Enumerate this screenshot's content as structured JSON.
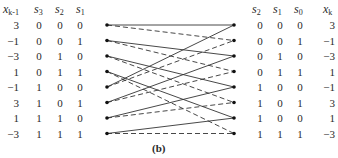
{
  "figure": {
    "caption": "(b)",
    "left_table": {
      "headers": [
        {
          "var": "x",
          "sub": "k-1"
        },
        {
          "var": "s",
          "sub": "3"
        },
        {
          "var": "s",
          "sub": "2"
        },
        {
          "var": "s",
          "sub": "1"
        }
      ],
      "rows": [
        [
          "3",
          "0",
          "0",
          "0"
        ],
        [
          "−1",
          "0",
          "0",
          "1"
        ],
        [
          "−3",
          "0",
          "1",
          "0"
        ],
        [
          "1",
          "0",
          "1",
          "1"
        ],
        [
          "−1",
          "1",
          "0",
          "0"
        ],
        [
          "3",
          "1",
          "0",
          "1"
        ],
        [
          "1",
          "1",
          "1",
          "0"
        ],
        [
          "−3",
          "1",
          "1",
          "1"
        ]
      ]
    },
    "right_table": {
      "headers": [
        {
          "var": "s",
          "sub": "2"
        },
        {
          "var": "s",
          "sub": "1"
        },
        {
          "var": "s",
          "sub": "0"
        },
        {
          "var": "x",
          "sub": "k"
        }
      ],
      "rows": [
        [
          "0",
          "0",
          "0",
          "3"
        ],
        [
          "0",
          "0",
          "1",
          "−1"
        ],
        [
          "0",
          "1",
          "0",
          "−3"
        ],
        [
          "0",
          "1",
          "1",
          "1"
        ],
        [
          "1",
          "0",
          "0",
          "−1"
        ],
        [
          "1",
          "0",
          "1",
          "3"
        ],
        [
          "1",
          "0",
          "0",
          "1"
        ],
        [
          "1",
          "1",
          "1",
          "−3"
        ]
      ]
    },
    "trellis": {
      "num_states": 8,
      "left_x": 107,
      "right_x": 234,
      "row_y": [
        25,
        40.5,
        56,
        71.5,
        87,
        102.5,
        118,
        133.5
      ],
      "edge_rule": "next = ((state << 1) & 7) | s0",
      "solid_meaning": "s0 = 0",
      "dashed_meaning": "s0 = 1",
      "line_color": "#333333"
    }
  }
}
